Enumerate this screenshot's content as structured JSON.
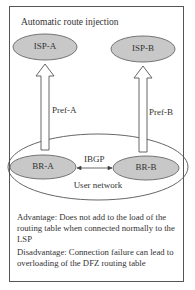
{
  "diagram": {
    "title": "Automatic route injection",
    "nodes": {
      "isp_a": "ISP-A",
      "isp_b": "ISP-B",
      "br_a": "BR-A",
      "br_b": "BR-B",
      "user_network": "User network"
    },
    "edges": {
      "pref_a": "Pref-A",
      "pref_b": "Pref-B",
      "ibgp": "IBGP"
    },
    "notes": {
      "advantage": "Advantage: Does not add to the load of the routing table when connected normally to the LSP",
      "disadvantage": "Disadvantage: Connection failure can lead to overloading of the DFZ routing table"
    },
    "colors": {
      "node_fill": "#c8c8c8",
      "stroke": "#555555",
      "frame": "#555555"
    }
  }
}
